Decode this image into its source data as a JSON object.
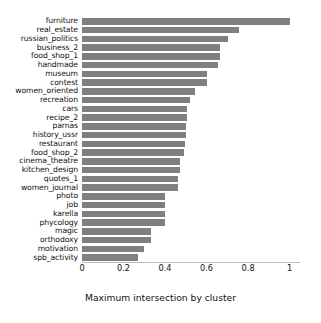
{
  "chart_data": {
    "type": "bar",
    "orientation": "horizontal",
    "title": "",
    "xlabel": "Maximum intersection by cluster",
    "ylabel": "",
    "xlim": [
      0,
      1.05
    ],
    "xticks": [
      0,
      0.2,
      0.4,
      0.6,
      0.8,
      1
    ],
    "xtick_labels": [
      "0",
      "0.2",
      "0.4",
      "0.6",
      "0.8",
      "1"
    ],
    "grid": false,
    "legend": null,
    "bar_color": "#808080",
    "categories": [
      "furniture",
      "real_estate",
      "russian_politics",
      "business_2",
      "food_shop_1",
      "handmade",
      "museum",
      "contest",
      "women_oriented",
      "recreation",
      "cars",
      "recipe_2",
      "parnas",
      "history_ussr",
      "restaurant",
      "food_shop_2",
      "cinema_theatre",
      "kitchen_design",
      "quotes_1",
      "women_journal",
      "photo",
      "job",
      "karella",
      "phycology",
      "magic",
      "orthodoxy",
      "motivation",
      "spb_activity"
    ],
    "values": [
      1.0,
      0.755,
      0.705,
      0.663,
      0.663,
      0.655,
      0.6,
      0.6,
      0.545,
      0.518,
      0.505,
      0.505,
      0.5,
      0.5,
      0.495,
      0.49,
      0.47,
      0.47,
      0.462,
      0.462,
      0.4,
      0.4,
      0.4,
      0.4,
      0.33,
      0.33,
      0.3,
      0.27
    ]
  },
  "axis": {
    "xlabel": "Maximum intersection by cluster"
  },
  "watermark": {
    "text": ""
  }
}
